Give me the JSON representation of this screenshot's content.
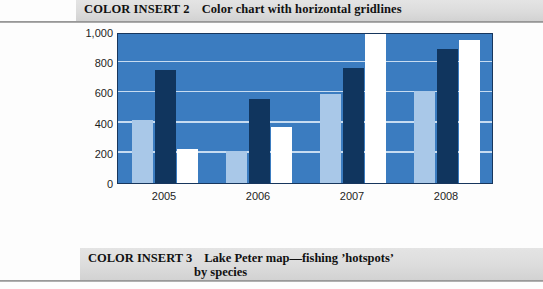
{
  "caption_top": {
    "insert_id": "COLOR INSERT 2",
    "text": "Color chart with horizontal gridlines"
  },
  "caption_bottom": {
    "insert_id": "COLOR INSERT 3",
    "line1": "Lake Peter map—fishing ʼhotspotsʼ",
    "line2": "by species"
  },
  "colors": {
    "plot_background": "#3b7cc0",
    "plot_border": "#17365d",
    "gridline": "#cfe2f3",
    "series_1": "#a9c8e8",
    "series_2": "#10355e",
    "series_3": "#ffffff",
    "caption_band": "#dcdcdc"
  },
  "chart_data": {
    "type": "bar",
    "title": "Color chart with horizontal gridlines",
    "xlabel": "",
    "ylabel": "",
    "ylim": [
      0,
      1000
    ],
    "yticks": [
      0,
      200,
      400,
      600,
      800,
      1000
    ],
    "ytick_labels": [
      "0",
      "200",
      "400",
      "600",
      "800",
      "1,000"
    ],
    "grid": true,
    "legend": false,
    "categories": [
      "2005",
      "2006",
      "2007",
      "2008"
    ],
    "series": [
      {
        "name": "Series 1",
        "color": "#a9c8e8",
        "values": [
          420,
          215,
          590,
          610
        ]
      },
      {
        "name": "Series 2",
        "color": "#10355e",
        "values": [
          750,
          555,
          760,
          885
        ]
      },
      {
        "name": "Series 3",
        "color": "#ffffff",
        "values": [
          225,
          370,
          985,
          950
        ]
      }
    ]
  }
}
